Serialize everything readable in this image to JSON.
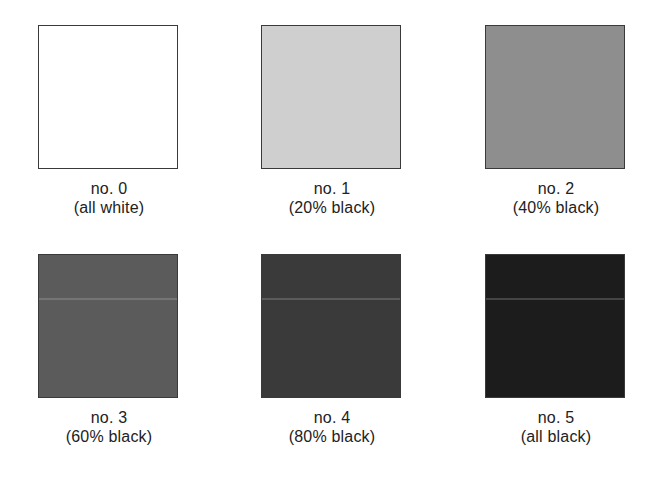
{
  "swatches": [
    {
      "number": "no. 0",
      "description": "(all white)",
      "fill": "#ffffff",
      "seam": false
    },
    {
      "number": "no. 1",
      "description": "(20% black)",
      "fill": "#cfcfcf",
      "seam": false
    },
    {
      "number": "no. 2",
      "description": "(40% black)",
      "fill": "#8e8e8e",
      "seam": false
    },
    {
      "number": "no. 3",
      "description": "(60% black)",
      "fill": "#5b5b5b",
      "seam": true,
      "seam_color": "#8a8a8a"
    },
    {
      "number": "no. 4",
      "description": "(80% black)",
      "fill": "#3a3a3a",
      "seam": true,
      "seam_color": "#777777"
    },
    {
      "number": "no. 5",
      "description": "(all black)",
      "fill": "#1c1c1c",
      "seam": true,
      "seam_color": "#666666"
    }
  ]
}
